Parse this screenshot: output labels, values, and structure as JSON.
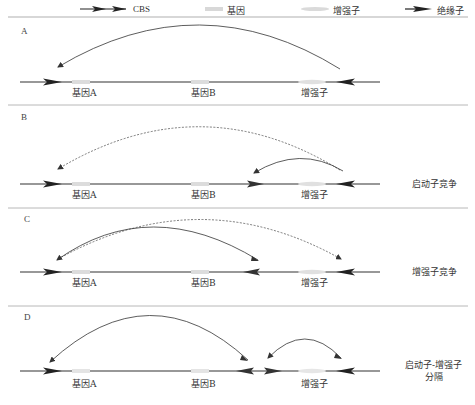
{
  "legend": {
    "items": [
      {
        "icon": "cbs-double-arrow-icon",
        "label": "CBS"
      },
      {
        "icon": "gene-box-icon",
        "label": "基因"
      },
      {
        "icon": "enhancer-oval-icon",
        "label": "增强子"
      },
      {
        "icon": "insulator-arrow-icon",
        "label": "绝缘子"
      }
    ]
  },
  "panels": [
    {
      "id": "A",
      "letter": "A",
      "description": "",
      "elements": {
        "gene_a": "基因A",
        "gene_b": "基因B",
        "enhancer": "增强子"
      },
      "loops": [
        {
          "from": "enhancer",
          "to": "gene_a",
          "style": "solid"
        }
      ]
    },
    {
      "id": "B",
      "letter": "B",
      "description": "启动子竞争",
      "elements": {
        "gene_a": "基因A",
        "gene_b": "基因B",
        "enhancer": "增强子"
      },
      "loops": [
        {
          "from": "enhancer",
          "to": "gene_a",
          "style": "dashed"
        },
        {
          "from": "enhancer",
          "to": "insulator_b",
          "style": "solid"
        }
      ]
    },
    {
      "id": "C",
      "letter": "C",
      "description": "增强子竞争",
      "elements": {
        "gene_a": "基因A",
        "gene_b": "基因B",
        "enhancer": "增强子"
      },
      "loops": [
        {
          "from": "gene_a",
          "to": "enhancer",
          "style": "dashed"
        },
        {
          "from": "gene_a",
          "to": "insulator_b",
          "style": "solid"
        }
      ]
    },
    {
      "id": "D",
      "letter": "D",
      "description": "启动子-增强子\n分隔",
      "description_lines": [
        "启动子-增强子",
        "分隔"
      ],
      "elements": {
        "gene_a": "基因A",
        "gene_b": "基因B",
        "enhancer": "增强子"
      },
      "loops": [
        {
          "from": "gene_a",
          "to": "gene_b_cbs",
          "style": "solid"
        },
        {
          "from": "enhancer_cbs_left",
          "to": "enhancer_cbs_right",
          "style": "solid"
        }
      ]
    }
  ],
  "colors": {
    "line": "#333333",
    "divider": "#b0b0b0",
    "gene_box": "#dcdcdc",
    "enhancer": "#e2e2e2",
    "arrow_fill": "#222222"
  }
}
